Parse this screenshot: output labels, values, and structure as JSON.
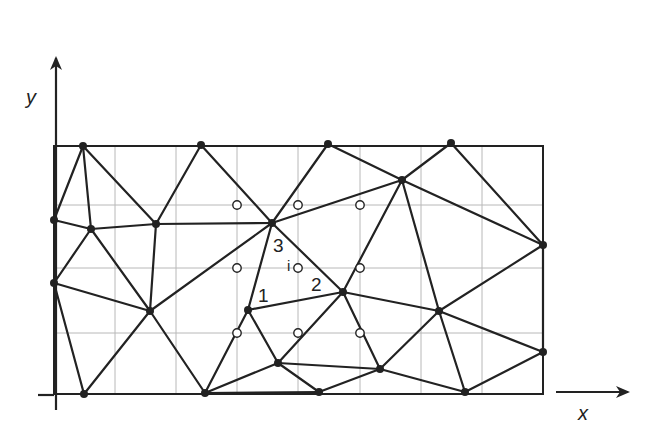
{
  "axes": {
    "x_label": "x",
    "y_label": "y"
  },
  "labels": {
    "vertex_1": "1",
    "vertex_2": "2",
    "vertex_3": "3",
    "point_i": "i"
  },
  "colors": {
    "line": "#222222",
    "grid": "#b8b8b8",
    "background": "#ffffff"
  },
  "domain_rect": {
    "x0": 54,
    "y0": 146,
    "x1": 543,
    "y1": 394
  },
  "grid": {
    "verticals": [
      115,
      176,
      237,
      298,
      360,
      421,
      482
    ],
    "horizontals": [
      205,
      268,
      333
    ]
  },
  "nodes": [
    {
      "id": "A",
      "x": 83,
      "y": 146
    },
    {
      "id": "B",
      "x": 201,
      "y": 145
    },
    {
      "id": "C",
      "x": 328,
      "y": 144
    },
    {
      "id": "D",
      "x": 451,
      "y": 143
    },
    {
      "id": "E",
      "x": 54,
      "y": 220
    },
    {
      "id": "F",
      "x": 91,
      "y": 229
    },
    {
      "id": "G",
      "x": 156,
      "y": 224
    },
    {
      "id": "H",
      "x": 272,
      "y": 223
    },
    {
      "id": "I",
      "x": 402,
      "y": 180
    },
    {
      "id": "J",
      "x": 543,
      "y": 245
    },
    {
      "id": "K",
      "x": 54,
      "y": 283
    },
    {
      "id": "L",
      "x": 150,
      "y": 311
    },
    {
      "id": "M",
      "x": 248,
      "y": 310
    },
    {
      "id": "N",
      "x": 343,
      "y": 292
    },
    {
      "id": "O",
      "x": 439,
      "y": 311
    },
    {
      "id": "P",
      "x": 543,
      "y": 352
    },
    {
      "id": "Q",
      "x": 278,
      "y": 363
    },
    {
      "id": "R",
      "x": 380,
      "y": 369
    },
    {
      "id": "S",
      "x": 84,
      "y": 394
    },
    {
      "id": "T",
      "x": 205,
      "y": 393
    },
    {
      "id": "U",
      "x": 319,
      "y": 392
    },
    {
      "id": "V",
      "x": 465,
      "y": 392
    }
  ],
  "edges": [
    [
      "A",
      "E"
    ],
    [
      "A",
      "F"
    ],
    [
      "A",
      "G"
    ],
    [
      "B",
      "G"
    ],
    [
      "B",
      "H"
    ],
    [
      "C",
      "H"
    ],
    [
      "C",
      "I"
    ],
    [
      "D",
      "I"
    ],
    [
      "D",
      "J"
    ],
    [
      "E",
      "F"
    ],
    [
      "F",
      "G"
    ],
    [
      "G",
      "H"
    ],
    [
      "H",
      "I"
    ],
    [
      "I",
      "J"
    ],
    [
      "F",
      "K"
    ],
    [
      "F",
      "L"
    ],
    [
      "G",
      "L"
    ],
    [
      "H",
      "L"
    ],
    [
      "H",
      "M"
    ],
    [
      "H",
      "N"
    ],
    [
      "I",
      "N"
    ],
    [
      "I",
      "O"
    ],
    [
      "J",
      "O"
    ],
    [
      "K",
      "L"
    ],
    [
      "K",
      "S"
    ],
    [
      "L",
      "S"
    ],
    [
      "L",
      "T"
    ],
    [
      "M",
      "N"
    ],
    [
      "M",
      "Q"
    ],
    [
      "M",
      "T"
    ],
    [
      "N",
      "O"
    ],
    [
      "N",
      "Q"
    ],
    [
      "N",
      "R"
    ],
    [
      "O",
      "R"
    ],
    [
      "O",
      "P"
    ],
    [
      "O",
      "V"
    ],
    [
      "P",
      "V"
    ],
    [
      "J",
      "P"
    ],
    [
      "Q",
      "R"
    ],
    [
      "Q",
      "T"
    ],
    [
      "Q",
      "U"
    ],
    [
      "R",
      "U"
    ],
    [
      "R",
      "V"
    ],
    [
      "T",
      "U"
    ]
  ],
  "open_points": [
    {
      "x": 237,
      "y": 205
    },
    {
      "x": 298,
      "y": 205
    },
    {
      "x": 360,
      "y": 205
    },
    {
      "x": 237,
      "y": 268
    },
    {
      "x": 298,
      "y": 268
    },
    {
      "x": 360,
      "y": 268
    },
    {
      "x": 237,
      "y": 333
    },
    {
      "x": 298,
      "y": 333
    },
    {
      "x": 360,
      "y": 333
    }
  ]
}
